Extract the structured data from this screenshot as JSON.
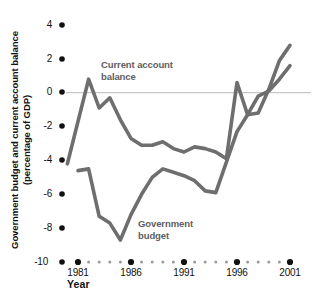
{
  "chart_data": {
    "type": "line",
    "title": "",
    "subtitle": "",
    "xlabel": "Year",
    "ylabel": "Government budget and current account balance (percentage of GDP)",
    "xlim": [
      1980,
      2001
    ],
    "ylim": [
      -10,
      4
    ],
    "xticks": [
      1981,
      1986,
      1991,
      1996,
      2001
    ],
    "xtick_labels": [
      "1981",
      "1986",
      "1991",
      "1996",
      "2001"
    ],
    "yticks": [
      4,
      2,
      0,
      -2,
      -4,
      -6,
      -8,
      -10
    ],
    "ytick_labels": [
      "4",
      "2",
      "0",
      "-2",
      "-4",
      "-6",
      "-8",
      "-10"
    ],
    "grid": false,
    "zero_line": true,
    "legend_position": "inline-annotations",
    "line_color": "#6e6e6e",
    "zero_line_color": "#b9b9b9",
    "series": [
      {
        "name": "Current account balance",
        "color": "#6e6e6e",
        "x": [
          1980,
          1981,
          1982,
          1983,
          1984,
          1985,
          1986,
          1987,
          1988,
          1989,
          1990,
          1991,
          1992,
          1993,
          1994,
          1995,
          1996,
          1997,
          1998,
          1999,
          2000,
          2001
        ],
        "values": [
          -4.2,
          -1.7,
          0.8,
          -0.9,
          -0.3,
          -1.6,
          -2.7,
          -3.1,
          -3.1,
          -2.9,
          -3.3,
          -3.5,
          -3.2,
          -3.3,
          -3.5,
          -3.9,
          0.6,
          -1.3,
          -1.2,
          0.2,
          1.9,
          2.8
        ]
      },
      {
        "name": "Government budget",
        "color": "#6e6e6e",
        "x": [
          1981,
          1982,
          1983,
          1984,
          1985,
          1986,
          1987,
          1988,
          1989,
          1990,
          1991,
          1992,
          1993,
          1994,
          1995,
          1996,
          1997,
          1998,
          1999,
          2000,
          2001
        ],
        "values": [
          -4.6,
          -4.5,
          -7.3,
          -7.7,
          -8.7,
          -7.2,
          -6.0,
          -5.0,
          -4.5,
          -4.7,
          -4.9,
          -5.2,
          -5.8,
          -5.9,
          -4.1,
          -2.3,
          -1.3,
          -0.2,
          0.1,
          0.8,
          1.6
        ]
      }
    ],
    "annotations": [
      {
        "text_line1": "Current account",
        "text_line2": "balance"
      },
      {
        "text_line1": "Government",
        "text_line2": "budget"
      }
    ]
  },
  "axis": {
    "y_title_line1": "Government budget and current account balance",
    "y_title_line2": "(percentage of GDP)",
    "x_title": "Year"
  }
}
